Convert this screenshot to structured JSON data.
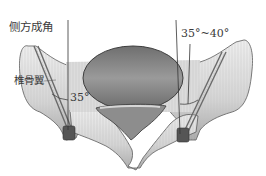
{
  "figure": {
    "labels": {
      "lateral_angle": "侧方成角",
      "angle_range": "35°~40°",
      "angle_left": "35°",
      "lamina": "椎骨翼"
    },
    "colors": {
      "bone_light": "#e6e6e6",
      "bone_mid": "#c4c4c4",
      "bone_dark": "#7e7e7e",
      "body_fill": "#8c8c8c",
      "outline": "#4a4a4a",
      "screw": "#5a5a5a",
      "text": "#3a3a3a"
    }
  }
}
